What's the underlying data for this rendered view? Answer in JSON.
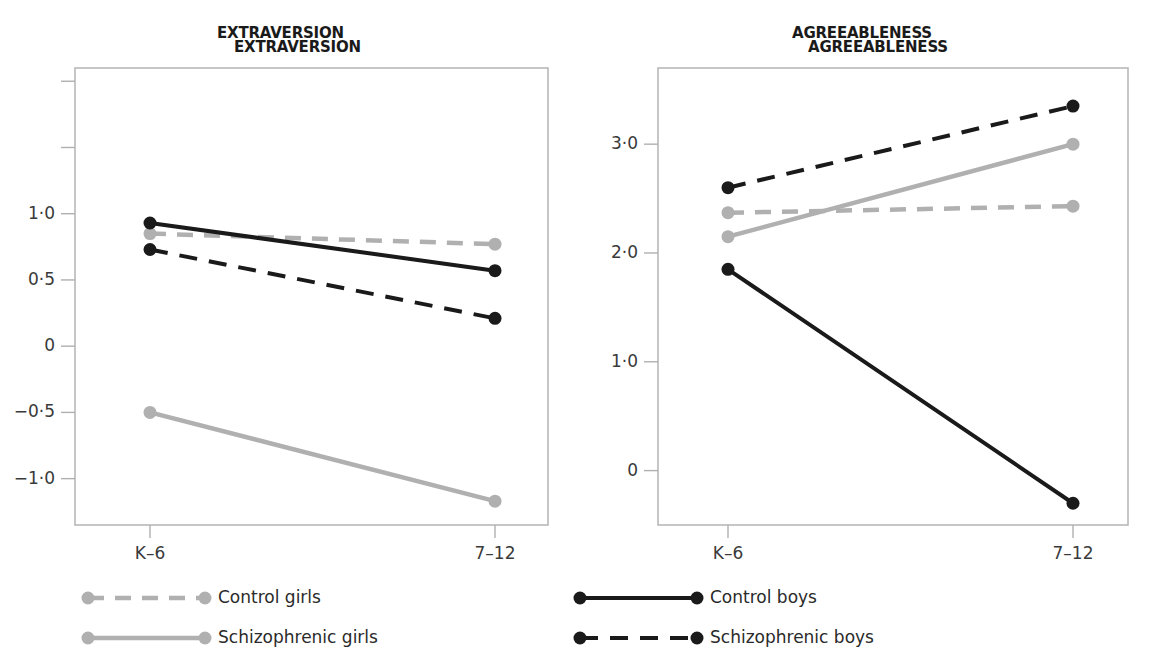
{
  "chart_data": [
    {
      "type": "line",
      "title": "EXTRAVERSION",
      "xlabel": "",
      "ylabel": "",
      "categories": [
        "K–6",
        "7–12"
      ],
      "ytick_labels": [
        "1·0",
        "0·5",
        "0",
        "−0·5",
        "−1·0"
      ],
      "ytick_values": [
        1.0,
        0.5,
        0,
        -0.5,
        -1.0
      ],
      "ylim": [
        -1.35,
        2.1
      ],
      "grid": false,
      "legend_position": "below",
      "series": [
        {
          "name": "Control girls",
          "values": [
            0.85,
            0.77
          ],
          "color": "#b0b0b0",
          "style": "dashed"
        },
        {
          "name": "Schizophrenic girls",
          "values": [
            -0.5,
            -1.17
          ],
          "color": "#b0b0b0",
          "style": "solid"
        },
        {
          "name": "Control boys",
          "values": [
            0.93,
            0.57
          ],
          "color": "#1a1a1a",
          "style": "solid"
        },
        {
          "name": "Schizophrenic boys",
          "values": [
            0.73,
            0.21
          ],
          "color": "#1a1a1a",
          "style": "dashed"
        }
      ]
    },
    {
      "type": "line",
      "title": "AGREEABLENESS",
      "xlabel": "",
      "ylabel": "",
      "categories": [
        "K–6",
        "7–12"
      ],
      "ytick_labels": [
        "3·0",
        "2·0",
        "1·0",
        "0"
      ],
      "ytick_values": [
        3.0,
        2.0,
        1.0,
        0
      ],
      "ylim": [
        -0.5,
        3.7
      ],
      "grid": false,
      "legend_position": "below",
      "series": [
        {
          "name": "Control girls",
          "values": [
            2.37,
            2.43
          ],
          "color": "#b0b0b0",
          "style": "dashed"
        },
        {
          "name": "Schizophrenic girls",
          "values": [
            2.15,
            3.0
          ],
          "color": "#b0b0b0",
          "style": "solid"
        },
        {
          "name": "Control boys",
          "values": [
            1.85,
            -0.3
          ],
          "color": "#1a1a1a",
          "style": "solid"
        },
        {
          "name": "Schizophrenic boys",
          "values": [
            2.6,
            3.35
          ],
          "color": "#1a1a1a",
          "style": "dashed"
        }
      ]
    }
  ],
  "legend": {
    "entries": [
      {
        "label": "Control girls",
        "color": "#b0b0b0",
        "style": "dashed"
      },
      {
        "label": "Schizophrenic girls",
        "color": "#b0b0b0",
        "style": "solid"
      },
      {
        "label": "Control boys",
        "color": "#1a1a1a",
        "style": "solid"
      },
      {
        "label": "Schizophrenic boys",
        "color": "#1a1a1a",
        "style": "dashed"
      }
    ]
  },
  "colors": {
    "gray_series": "#b0b0b0",
    "black_series": "#1a1a1a",
    "frame": "#b8b8b8",
    "text": "#2a2a2a",
    "background": "#ffffff"
  }
}
